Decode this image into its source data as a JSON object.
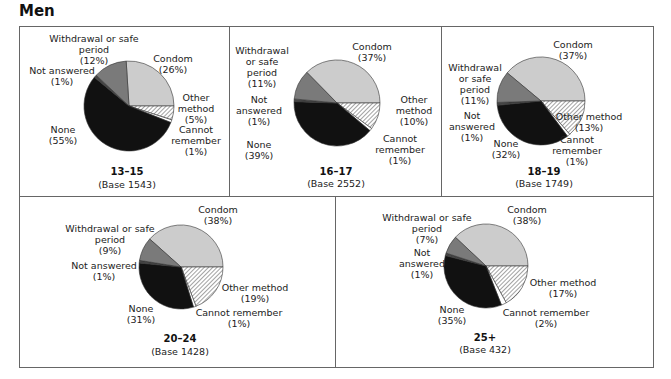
{
  "title": "Men",
  "colors": {
    "condom": "#cccccc",
    "other_method": "hatch",
    "cannot_remember": "#ffffff",
    "none": "#111111",
    "not_answered": "#444444",
    "withdrawal": "#7a7a7a"
  },
  "chart_data": [
    {
      "type": "pie",
      "title": "13–15",
      "base_label": "(Base  1543)",
      "categories": [
        "Condom",
        "Other method",
        "Cannot remember",
        "None",
        "Not answered",
        "Withdrawal or safe period"
      ],
      "values": [
        26,
        5,
        1,
        55,
        1,
        12
      ],
      "labels": [
        "Condom (26%)",
        "Other method (5%)",
        "Cannot remember (1%)",
        "None (55%)",
        "Not answered (1%)",
        "Withdrawal or safe period (12%)"
      ]
    },
    {
      "type": "pie",
      "title": "16–17",
      "base_label": "(Base  2552)",
      "categories": [
        "Condom",
        "Other method",
        "Cannot remember",
        "None",
        "Not answered",
        "Withdrawal or safe period"
      ],
      "values": [
        37,
        10,
        1,
        39,
        1,
        11
      ],
      "labels": [
        "Condom (37%)",
        "Other method (10%)",
        "Cannot remember (1%)",
        "None (39%)",
        "Not answered (1%)",
        "Withdrawal or safe period (11%)"
      ]
    },
    {
      "type": "pie",
      "title": "18–19",
      "base_label": "(Base  1749)",
      "categories": [
        "Condom",
        "Other method",
        "Cannot remember",
        "None",
        "Not answered",
        "Withdrawal or safe period"
      ],
      "values": [
        37,
        13,
        1,
        32,
        1,
        11
      ],
      "labels": [
        "Condom (37%)",
        "Other method (13%)",
        "Cannot remember (1%)",
        "None (32%)",
        "Not answered (1%)",
        "Withdrawal or safe period (11%)"
      ]
    },
    {
      "type": "pie",
      "title": "20–24",
      "base_label": "(Base  1428)",
      "categories": [
        "Condom",
        "Other method",
        "Cannot remember",
        "None",
        "Not answered",
        "Withdrawal or safe period"
      ],
      "values": [
        38,
        19,
        1,
        31,
        1,
        9
      ],
      "labels": [
        "Condom (38%)",
        "Other method (19%)",
        "Cannot remember (1%)",
        "None (31%)",
        "Not answered (1%)",
        "Withdrawal or safe period (9%)"
      ]
    },
    {
      "type": "pie",
      "title": "25+",
      "base_label": "(Base  432)",
      "categories": [
        "Condom",
        "Other method",
        "Cannot remember",
        "None",
        "Not answered",
        "Withdrawal or safe period"
      ],
      "values": [
        38,
        17,
        2,
        35,
        1,
        7
      ],
      "labels": [
        "Condom (38%)",
        "Other method (17%)",
        "Cannot remember (2%)",
        "None (35%)",
        "Not answered (1%)",
        "Withdrawal or safe period (7%)"
      ]
    }
  ],
  "panels": [
    {
      "age": "13–15",
      "base": "(Base  1543)",
      "text": {
        "withdrawal": [
          "Withdrawal or safe",
          "period",
          "(12%)"
        ],
        "not_answered": [
          "Not answered",
          "(1%)"
        ],
        "none": [
          "None",
          "(55%)"
        ],
        "condom": [
          "Condom",
          "(26%)"
        ],
        "other": [
          "Other",
          "method",
          "(5%)"
        ],
        "cannot": [
          "Cannot",
          "remember",
          "(1%)"
        ]
      }
    },
    {
      "age": "16–17",
      "base": "(Base  2552)",
      "text": {
        "withdrawal": [
          "Withdrawal",
          "or safe",
          "period",
          "(11%)"
        ],
        "not_answered": [
          "Not",
          "answered",
          "(1%)"
        ],
        "none": [
          "None",
          "(39%)"
        ],
        "condom": [
          "Condom",
          "(37%)"
        ],
        "other": [
          "Other",
          "method",
          "(10%)"
        ],
        "cannot": [
          "Cannot",
          "remember",
          "(1%)"
        ]
      }
    },
    {
      "age": "18–19",
      "base": "(Base  1749)",
      "text": {
        "withdrawal": [
          "Withdrawal",
          "or safe",
          "period",
          "(11%)"
        ],
        "not_answered": [
          "Not",
          "answered",
          "(1%)"
        ],
        "none": [
          "None",
          "(32%)"
        ],
        "condom": [
          "Condom",
          "(37%)"
        ],
        "other": [
          "Other method",
          "(13%)"
        ],
        "cannot": [
          "Cannot",
          "remember",
          "(1%)"
        ]
      }
    },
    {
      "age": "20–24",
      "base": "(Base  1428)",
      "text": {
        "withdrawal": [
          "Withdrawal or safe",
          "period",
          "(9%)"
        ],
        "not_answered": [
          "Not answered",
          "(1%)"
        ],
        "none": [
          "None",
          "(31%)"
        ],
        "condom": [
          "Condom",
          "(38%)"
        ],
        "other": [
          "Other method",
          "(19%)"
        ],
        "cannot": [
          "Cannot remember",
          "(1%)"
        ]
      }
    },
    {
      "age": "25+",
      "base": "(Base  432)",
      "text": {
        "withdrawal": [
          "Withdrawal or safe",
          "period",
          "(7%)"
        ],
        "not_answered": [
          "Not",
          "answered",
          "(1%)"
        ],
        "none": [
          "None",
          "(35%)"
        ],
        "condom": [
          "Condom",
          "(38%)"
        ],
        "other": [
          "Other method",
          "(17%)"
        ],
        "cannot": [
          "Cannot remember",
          "(2%)"
        ]
      }
    }
  ]
}
